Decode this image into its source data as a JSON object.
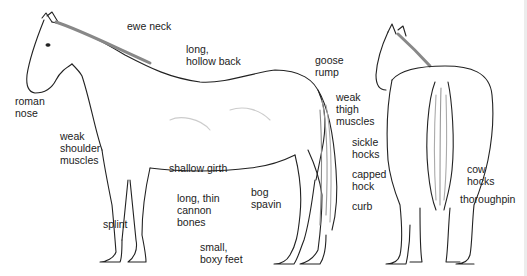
{
  "figure": {
    "views": [
      "side-view",
      "rear-view"
    ]
  },
  "labels": {
    "ewe_neck": "ewe neck",
    "hollow_back": "long,\nhollow back",
    "roman_nose": "roman\nnose",
    "goose_rump": "goose\nrump",
    "weak_thigh": "weak\nthigh\nmuscles",
    "weak_shoulder": "weak\nshoulder\nmuscles",
    "sickle_hocks": "sickle\nhocks",
    "shallow_girth": "shallow girth",
    "capped_hock": "capped\nhock",
    "cannon_bones": "long, thin\ncannon\nbones",
    "bog_spavin": "bog\nspavin",
    "curb": "curb",
    "cow_hocks": "cow\nhocks",
    "thoroughpin": "thoroughpin",
    "splint": "splint",
    "boxy_feet": "small,\nboxy feet"
  },
  "colors": {
    "ink": "#222222",
    "background": "#ffffff",
    "shade": "#bdbdbd"
  }
}
